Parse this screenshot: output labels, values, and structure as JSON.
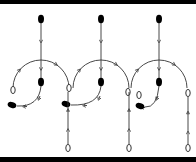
{
  "figure": {
    "colors": {
      "line": "#333333",
      "node_fill": "#000000",
      "background": "#ffffff",
      "bar": "#000000"
    },
    "panels": [
      {
        "id": "panel-1",
        "axis_x": 41,
        "top_node": {
          "type": "filled",
          "x": 41,
          "y": 19
        },
        "center_node": {
          "type": "filled",
          "x": 41,
          "y": 82
        },
        "lower_left_node": {
          "type": "filled",
          "x": 12,
          "y": 105
        },
        "left_open_node": {
          "type": "open",
          "x": 13,
          "y": 90
        },
        "arc": {
          "cx": 41,
          "cy": 88,
          "r": 28
        },
        "bottom_axis": false
      },
      {
        "id": "panel-2",
        "axis_x": 101,
        "top_node": {
          "type": "filled",
          "x": 101,
          "y": 19
        },
        "center_node": {
          "type": "filled",
          "x": 101,
          "y": 82
        },
        "lower_left_node": {
          "type": "filled",
          "x": 66,
          "y": 104
        },
        "left_open_node": {
          "type": "open",
          "x": 69,
          "y": 88
        },
        "right_open_node": {
          "type": "open",
          "x": 128,
          "y": 92
        },
        "arc": {
          "cx": 101,
          "cy": 88,
          "r": 28
        },
        "bottom_axis": true,
        "bottom_axis_x": 68
      },
      {
        "id": "panel-3",
        "axis_x": 159,
        "top_node": {
          "type": "filled",
          "x": 159,
          "y": 19
        },
        "center_node": {
          "type": "filled",
          "x": 159,
          "y": 82
        },
        "lower_left_node": {
          "type": "filled",
          "x": 140,
          "y": 106
        },
        "left_open_node": {
          "type": "open",
          "x": 139,
          "y": 95
        },
        "right_open_node": {
          "type": "open",
          "x": 188,
          "y": 93
        },
        "arc": {
          "cx": 159,
          "cy": 88,
          "r": 28
        },
        "bottom_axis": true,
        "bottom_axis_x": 129
      }
    ],
    "right_axis": {
      "x": 188,
      "top": 93,
      "bottom": 148
    },
    "bottom_open_nodes": [
      {
        "x": 68,
        "y": 148
      },
      {
        "x": 129,
        "y": 148
      },
      {
        "x": 188,
        "y": 148
      }
    ]
  }
}
